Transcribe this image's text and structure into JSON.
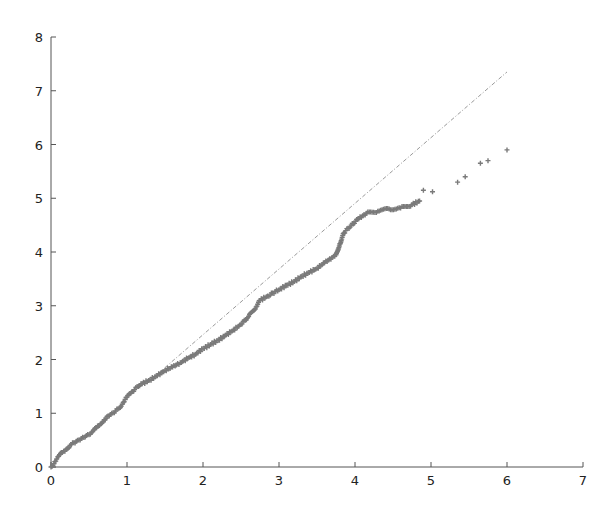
{
  "chart_data": {
    "type": "scatter",
    "title": "",
    "xlabel": "",
    "ylabel": "",
    "xlim": [
      0,
      7
    ],
    "ylim": [
      0,
      8
    ],
    "grid": false,
    "legend": null,
    "x_ticks": [
      "0",
      "1",
      "2",
      "3",
      "4",
      "5",
      "6",
      "7"
    ],
    "y_ticks": [
      "0",
      "1",
      "2",
      "3",
      "4",
      "5",
      "6",
      "7",
      "8"
    ],
    "series": [
      {
        "name": "observed",
        "marker": "+",
        "color": "#7a7a7a",
        "points": [
          [
            0.0,
            0.0
          ],
          [
            0.05,
            0.1
          ],
          [
            0.1,
            0.2
          ],
          [
            0.15,
            0.27
          ],
          [
            0.2,
            0.33
          ],
          [
            0.25,
            0.4
          ],
          [
            0.3,
            0.45
          ],
          [
            0.35,
            0.5
          ],
          [
            0.4,
            0.53
          ],
          [
            0.45,
            0.56
          ],
          [
            0.5,
            0.6
          ],
          [
            0.55,
            0.66
          ],
          [
            0.6,
            0.73
          ],
          [
            0.65,
            0.8
          ],
          [
            0.7,
            0.88
          ],
          [
            0.75,
            0.95
          ],
          [
            0.8,
            1.0
          ],
          [
            0.85,
            1.04
          ],
          [
            0.9,
            1.1
          ],
          [
            0.95,
            1.2
          ],
          [
            1.0,
            1.3
          ],
          [
            1.05,
            1.37
          ],
          [
            1.1,
            1.44
          ],
          [
            1.15,
            1.5
          ],
          [
            1.2,
            1.55
          ],
          [
            1.3,
            1.62
          ],
          [
            1.4,
            1.7
          ],
          [
            1.5,
            1.8
          ],
          [
            1.6,
            1.86
          ],
          [
            1.7,
            1.94
          ],
          [
            1.8,
            2.02
          ],
          [
            1.9,
            2.1
          ],
          [
            2.0,
            2.2
          ],
          [
            2.1,
            2.28
          ],
          [
            2.2,
            2.36
          ],
          [
            2.3,
            2.45
          ],
          [
            2.4,
            2.55
          ],
          [
            2.5,
            2.65
          ],
          [
            2.6,
            2.8
          ],
          [
            2.7,
            2.98
          ],
          [
            2.75,
            3.1
          ],
          [
            2.85,
            3.18
          ],
          [
            3.0,
            3.3
          ],
          [
            3.1,
            3.38
          ],
          [
            3.2,
            3.45
          ],
          [
            3.3,
            3.55
          ],
          [
            3.4,
            3.62
          ],
          [
            3.5,
            3.7
          ],
          [
            3.6,
            3.8
          ],
          [
            3.7,
            3.9
          ],
          [
            3.75,
            3.95
          ],
          [
            3.8,
            4.15
          ],
          [
            3.85,
            4.35
          ],
          [
            3.95,
            4.5
          ],
          [
            4.05,
            4.62
          ],
          [
            4.15,
            4.72
          ],
          [
            4.3,
            4.76
          ],
          [
            4.45,
            4.8
          ],
          [
            4.6,
            4.82
          ],
          [
            4.75,
            4.88
          ],
          [
            4.85,
            4.95
          ],
          [
            4.9,
            5.15
          ],
          [
            5.02,
            5.12
          ],
          [
            5.35,
            5.3
          ],
          [
            5.45,
            5.4
          ],
          [
            5.65,
            5.65
          ],
          [
            5.75,
            5.7
          ],
          [
            6.0,
            5.9
          ]
        ]
      },
      {
        "name": "reference",
        "style": "dash-dot",
        "color": "#9a9a9a",
        "points": [
          [
            1.5,
            1.85
          ],
          [
            6.0,
            7.35
          ]
        ]
      }
    ]
  }
}
